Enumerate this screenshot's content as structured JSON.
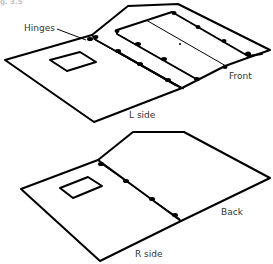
{
  "figure": {
    "caption_fragment": "g. 3.5",
    "top_assembly": {
      "labels": {
        "hinges": "Hinges",
        "front": "Front",
        "side": "L side"
      }
    },
    "bottom_assembly": {
      "labels": {
        "back": "Back",
        "side": "R side"
      }
    },
    "colors": {
      "line": "#000000",
      "label_text": "#333333",
      "background": "#ffffff"
    }
  }
}
